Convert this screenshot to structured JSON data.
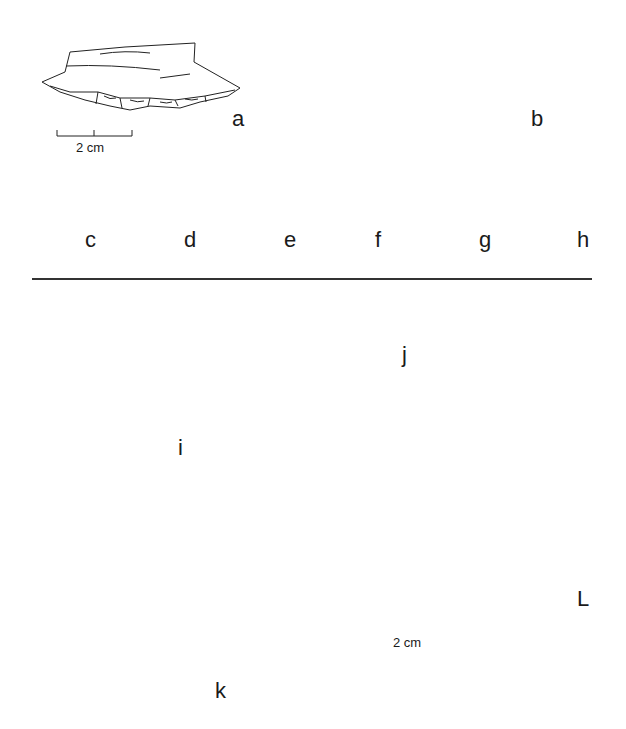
{
  "header": {
    "running_head": ""
  },
  "plate": {
    "upper_panel": {
      "description": "Lithic artefacts: flake and core (a, b) and blade segments (c–h)",
      "figures": [
        {
          "id": "a",
          "label": "a",
          "kind": "retouched flake"
        },
        {
          "id": "b",
          "label": "b",
          "kind": "core fragment, two views"
        },
        {
          "id": "c",
          "label": "c",
          "kind": "blade fragment"
        },
        {
          "id": "d",
          "label": "d",
          "kind": "blade segment"
        },
        {
          "id": "e",
          "label": "e",
          "kind": "blade segment"
        },
        {
          "id": "f",
          "label": "f",
          "kind": "blade segment"
        },
        {
          "id": "g",
          "label": "g",
          "kind": "blade segment"
        },
        {
          "id": "h",
          "label": "h",
          "kind": "blade segment"
        }
      ],
      "scale_bar": {
        "label": "2 cm"
      }
    },
    "lower_panel": {
      "description": "Ground stone objects with cross-sections (i–L)",
      "figures": [
        {
          "id": "i",
          "label": "i",
          "kind": "pebble / hammerstone with section"
        },
        {
          "id": "j",
          "label": "j",
          "kind": "domed fragment with section"
        },
        {
          "id": "k",
          "label": "k",
          "kind": "reconstructed section (dashed)"
        },
        {
          "id": "L",
          "label": "L",
          "kind": "domed fragment with section"
        }
      ],
      "scale_bar": {
        "label": "2 cm"
      }
    }
  },
  "colors": {
    "ink": "#1a1a1a",
    "paper": "#ffffff",
    "blade_fill": "#111111"
  }
}
